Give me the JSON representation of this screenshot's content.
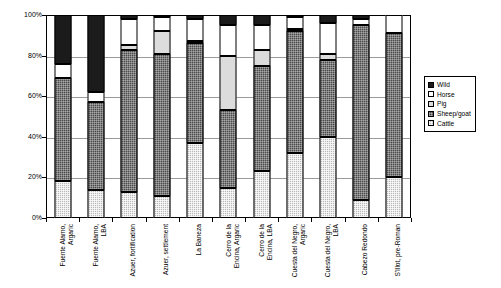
{
  "chart_data": {
    "type": "bar",
    "subtype": "stacked-percentage",
    "title": "",
    "xlabel": "",
    "ylabel": "",
    "ylim": [
      0,
      100
    ],
    "y_unit": "%",
    "grid": true,
    "legend_position": "right",
    "y_ticks": [
      "0%",
      "20%",
      "40%",
      "60%",
      "80%",
      "100%"
    ],
    "y_tick_values": [
      0,
      20,
      40,
      60,
      80,
      100
    ],
    "categories": [
      "Fuente Alamo, Argaric",
      "Fuente Alamo, LBA",
      "Azuer, fortification",
      "Azuer, settlement",
      "La Baneza",
      "Cerro de la Encina, Argaric",
      "Cerro de la Encina, LBA",
      "Cuesta del Negro, Argaric",
      "Cuesta del Negro, LBA",
      "Cabezo Redondo",
      "S'Illot, pre-Roman"
    ],
    "category_lines": [
      [
        "Fuente Alamo,",
        "Argaric"
      ],
      [
        "Fuente Alamo,",
        "LBA"
      ],
      [
        "Azuer, fortification"
      ],
      [
        "Azuer, settlement"
      ],
      [
        "La Baneza"
      ],
      [
        "Cerro de la",
        "Encina, Argaric"
      ],
      [
        "Cerro de la",
        "Encina, LBA"
      ],
      [
        "Cuesta del Negro,",
        "Argaric"
      ],
      [
        "Cuesta del Negro,",
        "LBA"
      ],
      [
        "Cabezo Redondo"
      ],
      [
        "S'Illot, pre-Roman"
      ]
    ],
    "series": [
      {
        "name": "Cattle",
        "color": "#b9b9b9",
        "pattern": "light-dotted",
        "values": [
          18,
          14,
          13,
          11,
          37,
          15,
          23,
          32,
          40,
          9,
          20
        ]
      },
      {
        "name": "Sheep/goat",
        "color": "#4a4a4a",
        "pattern": "dark-dotted",
        "values": [
          51,
          43,
          70,
          70,
          49,
          38,
          52,
          60,
          38,
          86,
          71
        ]
      },
      {
        "name": "Pig",
        "color": "#dcdcdc",
        "pattern": "solid-light",
        "values": [
          0,
          0,
          2,
          11,
          1,
          27,
          8,
          1,
          3,
          0,
          0
        ]
      },
      {
        "name": "Horse",
        "color": "#ffffff",
        "pattern": "solid-white",
        "values": [
          7,
          5,
          13,
          7,
          11,
          15,
          12,
          6,
          15,
          3,
          9
        ]
      },
      {
        "name": "Wild",
        "color": "#1b1b1b",
        "pattern": "solid-black",
        "values": [
          24,
          38,
          2,
          1,
          2,
          5,
          5,
          1,
          4,
          2,
          0
        ]
      }
    ],
    "stack_order_bottom_to_top": [
      "Cattle",
      "Sheep/goat",
      "Pig",
      "Horse",
      "Wild"
    ]
  },
  "legend": {
    "entries": [
      {
        "label": "Wild",
        "series": "Wild"
      },
      {
        "label": "Horse",
        "series": "Horse"
      },
      {
        "label": "Pig",
        "series": "Pig"
      },
      {
        "label": "Sheep/goat",
        "series": "Sheep/goat"
      },
      {
        "label": "Cattle",
        "series": "Cattle"
      }
    ]
  }
}
